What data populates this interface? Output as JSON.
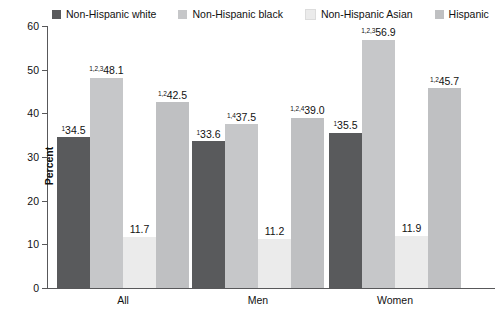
{
  "chart_data": {
    "type": "bar",
    "title": "",
    "xlabel": "",
    "ylabel": "Percent",
    "ylim": [
      0,
      60
    ],
    "yticks": [
      "0",
      "10",
      "20",
      "30",
      "40",
      "50",
      "60"
    ],
    "grid": false,
    "legend_position": "top",
    "categories": [
      "All",
      "Men",
      "Women"
    ],
    "series": [
      {
        "name": "Non-Hispanic white",
        "color": "#595a5c",
        "values": [
          34.5,
          33.6,
          35.5
        ],
        "labels": [
          "34.5",
          "33.6",
          "35.5"
        ],
        "superscripts": [
          "1",
          "1",
          "1"
        ]
      },
      {
        "name": "Non-Hispanic black",
        "color": "#c6c7c9",
        "values": [
          48.1,
          37.5,
          56.9
        ],
        "labels": [
          "48.1",
          "37.5",
          "56.9"
        ],
        "superscripts": [
          "1,2,3",
          "1,4",
          "1,2,3"
        ]
      },
      {
        "name": "Non-Hispanic Asian",
        "color": "#ebebeb",
        "values": [
          11.7,
          11.2,
          11.9
        ],
        "labels": [
          "11.7",
          "11.2",
          "11.9"
        ],
        "superscripts": [
          "",
          "",
          ""
        ]
      },
      {
        "name": "Hispanic",
        "color": "#bfc0c2",
        "values": [
          42.5,
          39.0,
          45.7
        ],
        "labels": [
          "42.5",
          "39.0",
          "45.7"
        ],
        "superscripts": [
          "1,2",
          "1,2,4",
          "1,2"
        ]
      }
    ]
  },
  "legend": {
    "items": [
      {
        "label": "Non-Hispanic white",
        "color": "#595a5c"
      },
      {
        "label": "Non-Hispanic black",
        "color": "#c6c7c9"
      },
      {
        "label": "Non-Hispanic Asian",
        "color": "#ebebeb"
      },
      {
        "label": "Hispanic",
        "color": "#bfc0c2"
      }
    ]
  },
  "axis": {
    "y_label": "Percent",
    "y_ticks": [
      "60",
      "50",
      "40",
      "30",
      "20",
      "10",
      "0"
    ]
  }
}
